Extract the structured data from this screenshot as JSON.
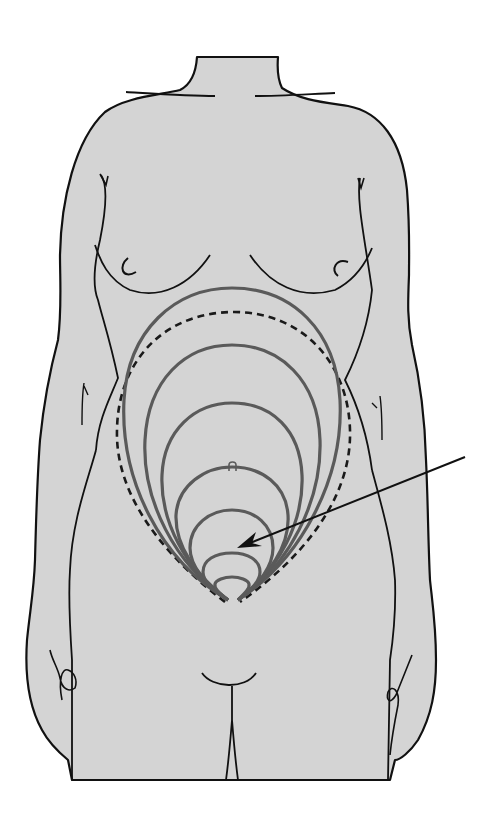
{
  "figure": {
    "colors": {
      "background": "#ffffff",
      "skin": "#d4d4d4",
      "outline": "#111111",
      "contour": "#5a5a5a",
      "dashed": "#1a1a1a",
      "arrow": "#111111"
    },
    "contours": [
      {
        "top": 288,
        "halfWidth": 110
      },
      {
        "top": 345,
        "halfWidth": 92
      },
      {
        "top": 403,
        "halfWidth": 78
      },
      {
        "top": 467,
        "halfWidth": 63
      },
      {
        "top": 510,
        "halfWidth": 48
      },
      {
        "top": 553,
        "halfWidth": 32
      },
      {
        "top": 580,
        "halfWidth": 18
      }
    ],
    "labels": []
  }
}
